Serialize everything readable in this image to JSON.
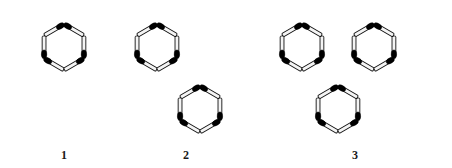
{
  "figure": {
    "title_visible": false,
    "background_color": "#ffffff",
    "ink_color": "#000000",
    "stick_fill_color": "#f4f4f4",
    "stick_outline_color": "#111111",
    "head_color": "#000000",
    "canvas": {
      "width": 452,
      "height": 168
    }
  },
  "chart_data": {
    "type": "diagram",
    "title": "",
    "stick_length": 40,
    "hex_radius": 23,
    "items": [
      {
        "label": "1",
        "label_x": 64,
        "label_y": 148,
        "hexagon_count": 1,
        "match_count": 6,
        "hex_centers": [
          {
            "cx": 64,
            "cy": 47
          }
        ]
      },
      {
        "label": "2",
        "label_x": 186,
        "label_y": 148,
        "hexagon_count": 2,
        "match_count": 11,
        "hex_centers": [
          {
            "cx": 157,
            "cy": 47
          },
          {
            "cx": 200,
            "cy": 109
          }
        ]
      },
      {
        "label": "3",
        "label_x": 355,
        "label_y": 148,
        "hexagon_count": 3,
        "match_count": 16,
        "hex_centers": [
          {
            "cx": 302,
            "cy": 47
          },
          {
            "cx": 374,
            "cy": 47
          },
          {
            "cx": 338,
            "cy": 109
          }
        ]
      }
    ]
  },
  "labels": {
    "one": "1",
    "two": "2",
    "three": "3"
  }
}
